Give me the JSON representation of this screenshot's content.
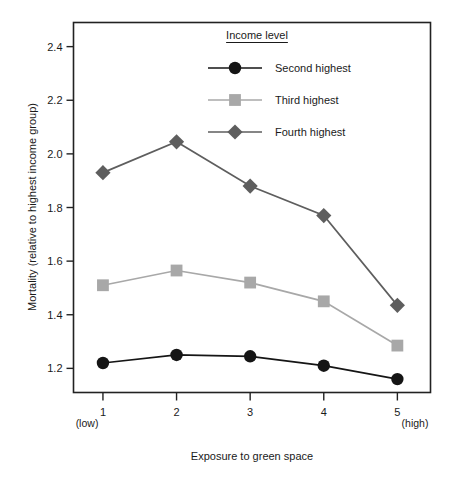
{
  "chart_data": {
    "type": "line",
    "title": "",
    "xlabel": "Exposure to green space",
    "ylabel": "Mortality (relative to highest income group)",
    "categories": [
      "1",
      "2",
      "3",
      "4",
      "5"
    ],
    "x": [
      1,
      2,
      3,
      4,
      5
    ],
    "xlim": [
      0.6,
      5.45
    ],
    "ylim": [
      1.11,
      2.49
    ],
    "yticks": [
      "1.2",
      "1.4",
      "1.6",
      "1.8",
      "2.0",
      "2.2",
      "2.4"
    ],
    "ytick_values": [
      1.2,
      1.4,
      1.6,
      1.8,
      2.0,
      2.2,
      2.4
    ],
    "xticks": [
      "1",
      "2",
      "3",
      "4",
      "5"
    ],
    "x_axis_low_label": "(low)",
    "x_axis_high_label": "(high)",
    "grid": false,
    "legend_position": "top-center-inside",
    "legend_title": "Income level",
    "series": [
      {
        "name": "Second highest",
        "marker": "circle",
        "color": "#151515",
        "values": [
          1.22,
          1.25,
          1.245,
          1.21,
          1.16
        ]
      },
      {
        "name": "Third highest",
        "marker": "square",
        "color": "#a8a8a8",
        "values": [
          1.51,
          1.565,
          1.52,
          1.45,
          1.285
        ]
      },
      {
        "name": "Fourth highest",
        "marker": "diamond",
        "color": "#5e5e5e",
        "values": [
          1.93,
          2.045,
          1.88,
          1.77,
          1.435
        ]
      }
    ]
  },
  "axes": {
    "y_title": "Mortality (relative to highest income group)",
    "x_title": "Exposure to green space",
    "y_tick_labels": [
      "1.2",
      "1.4",
      "1.6",
      "1.8",
      "2.0",
      "2.2",
      "2.4"
    ],
    "x_tick_labels": [
      "1",
      "2",
      "3",
      "4",
      "5"
    ],
    "x_low_annotation": "(low)",
    "x_high_annotation": "(high)"
  },
  "legend": {
    "title": "Income level",
    "items": [
      {
        "label": "Second highest",
        "marker": "circle-marker",
        "color": "#151515"
      },
      {
        "label": "Third highest",
        "marker": "square-marker",
        "color": "#a8a8a8"
      },
      {
        "label": "Fourth highest",
        "marker": "diamond-marker",
        "color": "#5e5e5e"
      }
    ]
  },
  "colors": {
    "frame": "#222222",
    "background": "#ffffff",
    "series_second": "#151515",
    "series_third": "#a8a8a8",
    "series_fourth": "#5e5e5e"
  }
}
